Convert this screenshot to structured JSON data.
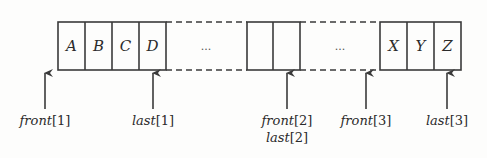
{
  "diagram": {
    "segments": [
      {
        "cells": [
          "A",
          "B",
          "C",
          "D"
        ]
      },
      {
        "gap_label": "..."
      },
      {
        "cells": [
          "",
          ""
        ]
      },
      {
        "gap_label": "..."
      },
      {
        "cells": [
          "X",
          "Y",
          "Z"
        ]
      }
    ],
    "pointers": [
      {
        "name": "front",
        "index": "1",
        "label": "front[1]"
      },
      {
        "name": "last",
        "index": "1",
        "label": "last[1]"
      },
      {
        "name": "front",
        "index": "2",
        "label": "front[2]"
      },
      {
        "name": "last",
        "index": "2",
        "label": "last[2]"
      },
      {
        "name": "front",
        "index": "3",
        "label": "front[3]"
      },
      {
        "name": "last",
        "index": "3",
        "label": "last[3]"
      }
    ],
    "colors": {
      "stroke": "#3a3a3a",
      "text": "#2b2b2b",
      "background": "#fdfdfc"
    }
  },
  "labels": {
    "cell_A": "A",
    "cell_B": "B",
    "cell_C": "C",
    "cell_D": "D",
    "cell_X": "X",
    "cell_Y": "Y",
    "cell_Z": "Z",
    "gap1": "...",
    "gap2": "...",
    "front": "front",
    "last": "last",
    "idx1": "[1]",
    "idx2": "[2]",
    "idx3": "[3]"
  }
}
